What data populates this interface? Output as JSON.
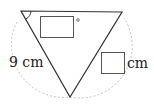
{
  "figure": {
    "shape": "triangle",
    "vertices": {
      "top_left": [
        21,
        11
      ],
      "top_right": [
        122,
        12
      ],
      "bottom": [
        70,
        97
      ]
    },
    "angle_marker": "arc at top-left vertex",
    "arc_style": "dashed gray circular arc",
    "line_color": "#333333",
    "arc_color": "#bbbbbb"
  },
  "labels": {
    "side_length": "9 cm",
    "answer_unit": "cm",
    "degree_symbol": "°"
  },
  "answer_boxes": {
    "angle_box": "",
    "length_box": ""
  }
}
